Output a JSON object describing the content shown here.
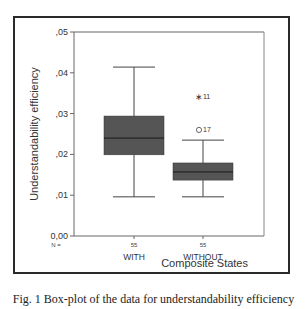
{
  "chart_data": {
    "type": "boxplot",
    "title": "",
    "xlabel": "Composite States",
    "ylabel": "Understandability efficiency",
    "ylim": [
      0.0,
      0.05
    ],
    "yticks": [
      ",05",
      ",04",
      ",03",
      ",02",
      ",01",
      "0,00"
    ],
    "ytick_values": [
      0.05,
      0.04,
      0.03,
      0.02,
      0.01,
      0.0
    ],
    "n_label": "N =",
    "categories": [
      "WITH",
      "WITHOUT"
    ],
    "n": [
      "55",
      "55"
    ],
    "series": [
      {
        "name": "WITH",
        "whisker_low": 0.0096,
        "q1": 0.0199,
        "median": 0.024,
        "q3": 0.0294,
        "whisker_high": 0.0414,
        "outliers": []
      },
      {
        "name": "WITHOUT",
        "whisker_low": 0.0096,
        "q1": 0.0137,
        "median": 0.0157,
        "q3": 0.0179,
        "whisker_high": 0.0235,
        "outliers": [
          {
            "case": "17",
            "value": 0.026,
            "marker": "circle",
            "label": "O17"
          },
          {
            "case": "11",
            "value": 0.0343,
            "marker": "star",
            "label": "*11"
          }
        ]
      }
    ],
    "grid": false,
    "legend": "none",
    "colors": {
      "box_fill": "#555555",
      "lines": "#444444",
      "frame": "#2a2a2a"
    }
  },
  "caption": "Fig. 1 Box-plot of the data for understandability efficiency"
}
